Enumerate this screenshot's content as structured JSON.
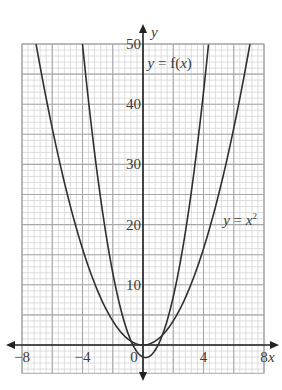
{
  "chart_data": {
    "type": "line",
    "title": "",
    "xlabel": "x",
    "ylabel": "y",
    "xlim": [
      -8,
      8
    ],
    "ylim": [
      -4.7,
      50
    ],
    "grid": true,
    "grid_major": {
      "x_step": 2,
      "y_step": 5
    },
    "grid_minor": {
      "x_step": 0.4,
      "y_step": 1
    },
    "x_ticks": [
      {
        "value": -8,
        "label": "−8"
      },
      {
        "value": -4,
        "label": "−4"
      },
      {
        "value": 0,
        "label": "0"
      },
      {
        "value": 4,
        "label": "4"
      },
      {
        "value": 8,
        "label": "8"
      }
    ],
    "y_ticks": [
      {
        "value": 10,
        "label": "10"
      },
      {
        "value": 20,
        "label": "20"
      },
      {
        "value": 30,
        "label": "30"
      },
      {
        "value": 40,
        "label": "40"
      },
      {
        "value": 50,
        "label": "50"
      }
    ],
    "series": [
      {
        "name": "y = x²",
        "label_main": "y = x",
        "label_sup": "2",
        "formula": "x^2",
        "label_position": {
          "x": 5.3,
          "y": 20
        },
        "x": [
          -7.07,
          -6,
          -5,
          -4,
          -3,
          -2,
          -1,
          0,
          1,
          2,
          3,
          4,
          5,
          6,
          7.07
        ],
        "y": [
          50,
          36,
          25,
          16,
          9,
          4,
          1,
          0,
          1,
          4,
          9,
          16,
          25,
          36,
          50
        ]
      },
      {
        "name": "y = f(x)",
        "label_main": "y = f(x)",
        "formula": "3x^2 - x - 2 (approx.)",
        "label_position": {
          "x": 0.3,
          "y": 46
        },
        "x": [
          -4,
          -3,
          -2,
          -1,
          -0.78,
          0,
          0.17,
          1,
          1.28,
          2,
          3,
          4,
          4.33
        ],
        "y": [
          50,
          28,
          12,
          2,
          0.61,
          -2,
          -2.08,
          0,
          1.64,
          8,
          22,
          42,
          50
        ]
      }
    ],
    "legend": "none (curves labeled inline)"
  },
  "colors": {
    "curve": "#2f2f2f",
    "axis": "#222222",
    "grid_major": "#a8a8a8",
    "grid_minor": "#d6d6d6",
    "text": "#3a3a3a"
  }
}
